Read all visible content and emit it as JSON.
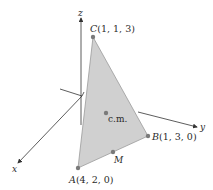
{
  "axes": {
    "x_label": "x",
    "y_label": "y",
    "z_label": "z"
  },
  "points": {
    "A": {
      "name": "A",
      "coords": "(4, 2, 0)"
    },
    "B": {
      "name": "B",
      "coords": "(1, 3, 0)"
    },
    "C": {
      "name": "C",
      "coords": "(1, 1, 3)"
    },
    "M": {
      "name": "M"
    },
    "cm": {
      "name": "c.m."
    }
  },
  "colors": {
    "triangle_fill": "#d0d0d0",
    "triangle_stroke": "#9a9a9a",
    "point": "#7a7a7a",
    "axis": "#333333"
  }
}
